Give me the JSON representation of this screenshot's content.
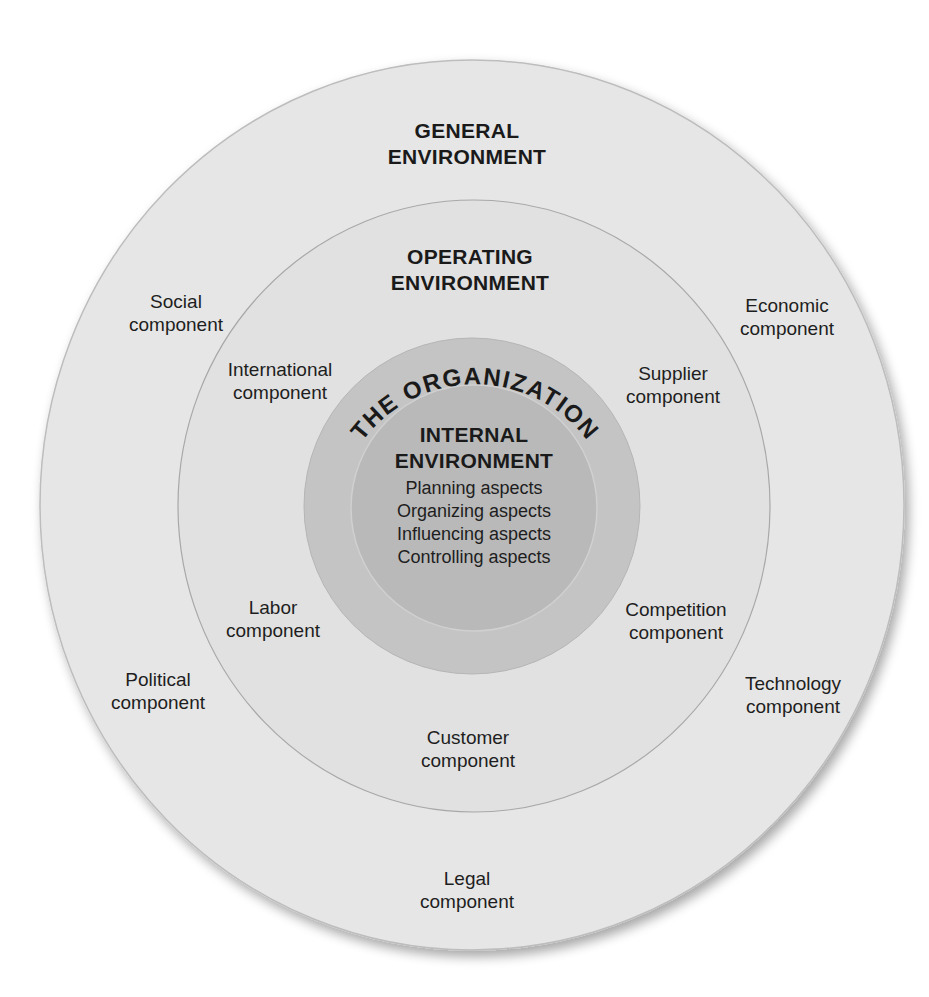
{
  "diagram": {
    "general": {
      "title_line1": "GENERAL",
      "title_line2": "ENVIRONMENT",
      "components": {
        "social": [
          "Social",
          "component"
        ],
        "economic": [
          "Economic",
          "component"
        ],
        "political": [
          "Political",
          "component"
        ],
        "technology": [
          "Technology",
          "component"
        ],
        "legal": [
          "Legal",
          "component"
        ]
      }
    },
    "operating": {
      "title_line1": "OPERATING",
      "title_line2": "ENVIRONMENT",
      "components": {
        "international": [
          "International",
          "component"
        ],
        "supplier": [
          "Supplier",
          "component"
        ],
        "labor": [
          "Labor",
          "component"
        ],
        "competition": [
          "Competition",
          "component"
        ],
        "customer": [
          "Customer",
          "component"
        ]
      }
    },
    "organization": {
      "arc_label": "THE ORGANIZATION"
    },
    "internal": {
      "title_line1": "INTERNAL",
      "title_line2": "ENVIRONMENT",
      "aspects": [
        "Planning aspects",
        "Organizing aspects",
        "Influencing aspects",
        "Controlling aspects"
      ]
    },
    "colors": {
      "general_fill": "#e6e6e6",
      "operating_fill": "#e1e1e1",
      "organization_fill": "#c4c4c4",
      "internal_fill": "#b9b9b9",
      "ring_stroke": "#b0b0b0"
    }
  }
}
